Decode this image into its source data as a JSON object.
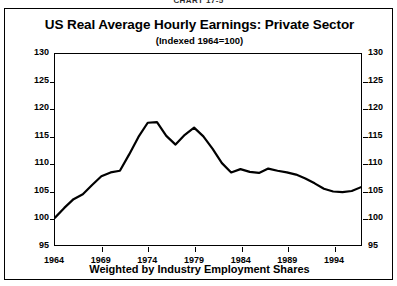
{
  "header": {
    "chart_number": "CHART 17-5"
  },
  "footnote": "Weighted by Industry Employment Shares",
  "chart_data": {
    "type": "line",
    "title": "US Real Average Hourly Earnings:  Private Sector",
    "subtitle": "(Indexed 1964=100)",
    "xlabel": "",
    "ylabel": "",
    "footnote": "Weighted by Industry Employment Shares",
    "grid": false,
    "legend": "none",
    "xlim": [
      1964,
      1997
    ],
    "ylim": [
      95,
      130
    ],
    "ytick_labels": [
      "130",
      "125",
      "120",
      "115",
      "110",
      "105",
      "100",
      "95"
    ],
    "ytick_values": [
      130,
      125,
      120,
      115,
      110,
      105,
      100,
      95
    ],
    "xtick_labels": [
      "1964",
      "1969",
      "1974",
      "1979",
      "1984",
      "1989",
      "1994"
    ],
    "xtick_values": [
      1964,
      1969,
      1974,
      1979,
      1984,
      1989,
      1994
    ],
    "axes": {
      "left_axis": true,
      "right_axis": true,
      "right_axis_mirrors_left": true
    },
    "line_color": "#000000",
    "line_width": 2.2,
    "series": [
      {
        "name": "US Real Average Hourly Earnings (Private Sector, 1964=100)",
        "x": [
          1964,
          1965,
          1966,
          1967,
          1968,
          1969,
          1970,
          1971,
          1972,
          1973,
          1974,
          1975,
          1976,
          1977,
          1978,
          1979,
          1980,
          1981,
          1982,
          1983,
          1984,
          1985,
          1986,
          1987,
          1988,
          1989,
          1990,
          1991,
          1992,
          1993,
          1994,
          1995,
          1996,
          1997
        ],
        "values": [
          100.0,
          101.8,
          103.4,
          104.3,
          106.0,
          107.6,
          108.3,
          108.6,
          111.6,
          114.8,
          117.4,
          117.5,
          115.0,
          113.4,
          115.2,
          116.5,
          114.9,
          112.6,
          110.0,
          108.3,
          108.9,
          108.4,
          108.2,
          109.0,
          108.6,
          108.3,
          107.9,
          107.2,
          106.3,
          105.3,
          104.8,
          104.7,
          104.9,
          105.6
        ]
      }
    ],
    "annotations": {
      "start_value": 100,
      "first_peak": {
        "year": 1974,
        "value": 117.5
      },
      "interim_trough": {
        "year": 1977,
        "value": 113.4
      },
      "second_peak": {
        "year": 1979,
        "value": 116.5
      },
      "final_trough": {
        "year": 1995,
        "value": 104.7
      },
      "end_value": 105.6
    }
  }
}
